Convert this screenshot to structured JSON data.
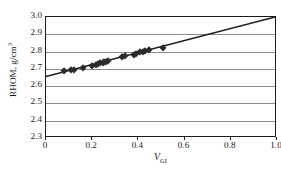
{
  "chart_data": {
    "type": "scatter",
    "title": "",
    "subtitle": "",
    "xlabel": "V",
    "xlabel_subscript": "GI",
    "xlabel_full": "V_GI",
    "ylabel": "RHOM, g/cm",
    "ylabel_superscript": "3",
    "ylabel_full": "RHOM, g/cm3",
    "xlim": [
      0,
      1.0
    ],
    "ylim": [
      2.3,
      3.0
    ],
    "xticks": [
      "0",
      "0.2",
      "0.4",
      "0.6",
      "0.8",
      "1.0"
    ],
    "xtick_values": [
      0,
      0.2,
      0.4,
      0.6,
      0.8,
      1.0
    ],
    "yticks": [
      "2.3",
      "2.4",
      "2.5",
      "2.6",
      "2.7",
      "2.8",
      "2.9",
      "3.0"
    ],
    "ytick_values": [
      2.3,
      2.4,
      2.5,
      2.6,
      2.7,
      2.8,
      2.9,
      3.0
    ],
    "grid": "horizontal",
    "legend": "none",
    "marker_style": "filled-diamond",
    "marker_color": "#2b2b2b",
    "line_color": "#1a1a1a",
    "grid_color": "#8c8c8c",
    "frame_color": "#1a1a1a",
    "background_color": "#ffffff",
    "series": [
      {
        "name": "measurements",
        "type": "scatter",
        "x": [
          0.08,
          0.11,
          0.12,
          0.16,
          0.2,
          0.215,
          0.225,
          0.235,
          0.245,
          0.25,
          0.26,
          0.27,
          0.33,
          0.34,
          0.38,
          0.39,
          0.405,
          0.42,
          0.43,
          0.445,
          0.505
        ],
        "y": [
          2.688,
          2.692,
          2.694,
          2.706,
          2.718,
          2.722,
          2.728,
          2.733,
          2.736,
          2.742,
          2.74,
          2.746,
          2.768,
          2.772,
          2.782,
          2.786,
          2.796,
          2.8,
          2.804,
          2.808,
          2.822
        ]
      },
      {
        "name": "regression-line",
        "type": "line",
        "x": [
          0,
          1.0
        ],
        "y": [
          2.65,
          3.0
        ],
        "slope": 0.35,
        "intercept": 2.65
      }
    ]
  }
}
